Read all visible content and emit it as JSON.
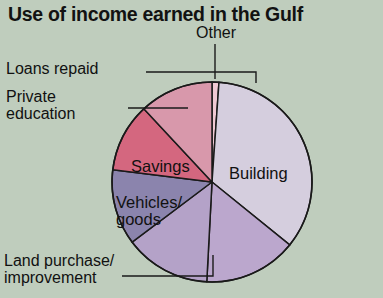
{
  "header": {
    "title": "Use of income earned in the Gulf"
  },
  "colors": {
    "background": "#bfcdbd",
    "outline": "#1a1a1a",
    "text": "#111111",
    "building": "#d5cede",
    "land_purchase": "#bba7cd",
    "vehicles_goods": "#b4a2c8",
    "savings": "#8b84ad",
    "private_education": "#d4677f",
    "loans_repaid": "#d898ab",
    "other": "#f0c9d3"
  },
  "labels": {
    "other": "Other",
    "loans_repaid": "Loans repaid",
    "private_education": "Private\neducation",
    "land_purchase": "Land purchase/\nimprovement",
    "building": "Building",
    "savings": "Savings",
    "vehicles_goods": "Vehicles/\ngoods"
  },
  "chart_data": {
    "type": "pie",
    "title": "Use of income earned in the Gulf",
    "xlabel": "",
    "ylabel": "",
    "legend_position": "callout-labels",
    "grid": false,
    "center": [
      212,
      182
    ],
    "radius": 100,
    "start_angle_deg": 0,
    "direction": "clockwise",
    "categories": [
      "Other",
      "Building",
      "Land purchase/improvement",
      "Vehicles/goods",
      "Savings",
      "Private education",
      "Loans repaid"
    ],
    "values": [
      1,
      35,
      15,
      14,
      12,
      11,
      12
    ],
    "unit": "percent",
    "slices": [
      {
        "name": "Other",
        "value": 1,
        "angle_deg": 4,
        "color": "#f0c9d3",
        "label_placement": "outside-top",
        "has_leader_line": true
      },
      {
        "name": "Building",
        "value": 35,
        "angle_deg": 125,
        "color": "#d5cede",
        "label_placement": "inside",
        "has_leader_line": false
      },
      {
        "name": "Land purchase/improvement",
        "value": 15,
        "angle_deg": 54,
        "color": "#bba7cd",
        "label_placement": "outside-bottom",
        "has_leader_line": true
      },
      {
        "name": "Vehicles/goods",
        "value": 14,
        "angle_deg": 50,
        "color": "#b4a2c8",
        "label_placement": "inside",
        "has_leader_line": false
      },
      {
        "name": "Savings",
        "value": 12,
        "angle_deg": 44,
        "color": "#8b84ad",
        "label_placement": "inside",
        "has_leader_line": false
      },
      {
        "name": "Private education",
        "value": 11,
        "angle_deg": 40,
        "color": "#d4677f",
        "label_placement": "outside-left",
        "has_leader_line": true
      },
      {
        "name": "Loans repaid",
        "value": 12,
        "angle_deg": 43,
        "color": "#d898ab",
        "label_placement": "outside-left",
        "has_leader_line": true
      }
    ]
  }
}
